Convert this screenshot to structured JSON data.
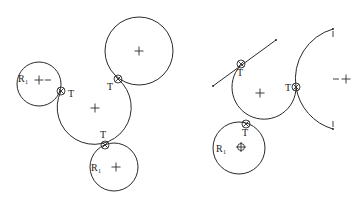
{
  "figure": {
    "left_panel": {
      "circles": [
        {
          "id": "r1-top",
          "label": "R",
          "subscript": "1",
          "cx": 39,
          "cy": 84,
          "r": 22,
          "center_mark": "+",
          "extra_mark": "–"
        },
        {
          "id": "large-top-right",
          "cx": 139,
          "cy": 51,
          "r": 34,
          "center_mark": "+"
        },
        {
          "id": "r1-bottom",
          "label": "R",
          "subscript": "1",
          "cx": 114,
          "cy": 167,
          "r": 24,
          "center_mark": "+"
        }
      ],
      "connecting_arc": {
        "cx": 95,
        "cy": 108,
        "r": 37,
        "center_mark": "+"
      },
      "tangent_points": [
        {
          "label": "T",
          "x": 61,
          "y": 91
        },
        {
          "label": "T",
          "x": 118,
          "y": 79
        },
        {
          "label": "T",
          "x": 105,
          "y": 145
        }
      ]
    },
    "right_panel": {
      "tangent_line": {
        "x1": 213,
        "y1": 86,
        "x2": 276,
        "y2": 40
      },
      "connecting_arc": {
        "cx": 260,
        "cy": 93,
        "r": 32,
        "center_mark": "+"
      },
      "circles": [
        {
          "id": "r1",
          "label": "R",
          "subscript": "1",
          "cx": 239,
          "cy": 148,
          "r": 26,
          "center_mark": "⊕"
        }
      ],
      "reverse_arc": {
        "cx": 346,
        "cy": 80,
        "r": 51,
        "center_mark": "–+",
        "end_marks": [
          "I",
          "I"
        ]
      },
      "tangent_points": [
        {
          "label": "T",
          "x": 240,
          "y": 62
        },
        {
          "label": "T",
          "x": 245,
          "y": 124
        },
        {
          "label": "T",
          "x": 296,
          "y": 86
        }
      ]
    }
  },
  "labels": {
    "t": "T",
    "r": "R",
    "r_sub": "1",
    "cross": "+",
    "minus": "–",
    "end_tick": "I"
  },
  "colors": {
    "stroke": "#2a2a2a",
    "background": "#ffffff"
  }
}
